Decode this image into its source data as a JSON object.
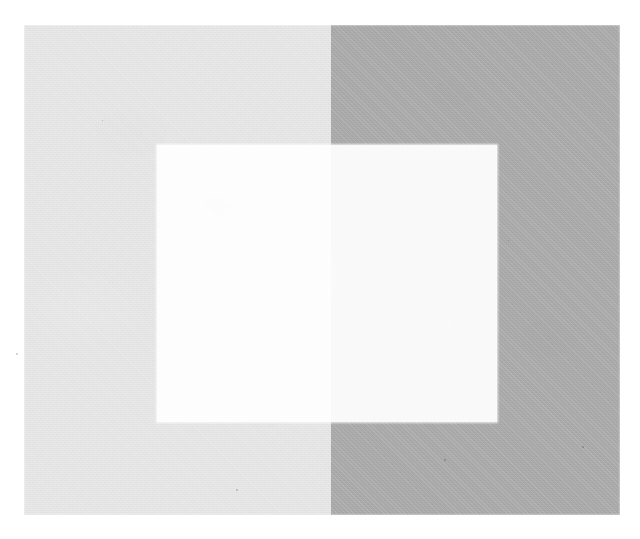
{
  "figure": {
    "caption": "",
    "background_color": "#ffffff",
    "width": 640,
    "height": 539
  },
  "chart_data": {
    "type": "heatmap",
    "subtitle": "",
    "xlabel": "",
    "ylabel": "",
    "grid": false,
    "legend_position": "none",
    "regions": [
      {
        "name": "surround-left",
        "label": "Light grey surround",
        "color": "#e8e8e8",
        "luminance": 232,
        "x": 24,
        "y": 25,
        "width": 307,
        "height": 490
      },
      {
        "name": "surround-right",
        "label": "Medium grey surround",
        "color": "#ababab",
        "luminance": 171,
        "x": 331,
        "y": 25,
        "width": 289,
        "height": 490
      },
      {
        "name": "test-patch-left",
        "label": "Test patch on light surround",
        "color": "#ffffff",
        "luminance": 255,
        "x": 157,
        "y": 145,
        "width": 174,
        "height": 277
      },
      {
        "name": "test-patch-right",
        "label": "Test patch on medium surround",
        "color": "#fbfbfb",
        "luminance": 251,
        "x": 331,
        "y": 145,
        "width": 166,
        "height": 277
      }
    ],
    "categories": [
      "Light grey surround",
      "Medium grey surround",
      "Test patch on light surround",
      "Test patch on medium surround"
    ],
    "values": [
      232,
      171,
      255,
      251
    ],
    "ylim": [
      0,
      255
    ],
    "annotations": [],
    "tick_labels": []
  },
  "layout": {
    "plate": {
      "x": 24,
      "y": 25,
      "width": 596,
      "height": 490
    },
    "plate_divider_x": 331,
    "inner_square": {
      "x": 157,
      "y": 145,
      "width": 340,
      "height": 277
    },
    "inner_divider_x": 331
  },
  "colors": {
    "page": "#ffffff",
    "surround_light": "#e8e8e8",
    "surround_dark": "#ababab",
    "patch_light": "#ffffff",
    "patch_dark": "#fbfbfb"
  },
  "texture": {
    "kind": "scanned-paper-grain",
    "specks": [
      {
        "x": 16,
        "y": 353,
        "size": 2
      },
      {
        "x": 236,
        "y": 489,
        "size": 2
      },
      {
        "x": 444,
        "y": 459,
        "size": 2
      },
      {
        "x": 582,
        "y": 446,
        "size": 2
      },
      {
        "x": 102,
        "y": 120,
        "size": 1
      },
      {
        "x": 508,
        "y": 240,
        "size": 1
      }
    ]
  }
}
